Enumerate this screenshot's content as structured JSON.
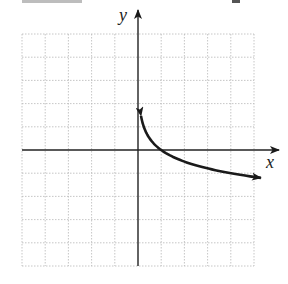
{
  "figure": {
    "x_axis_label": "x",
    "y_axis_label": "y",
    "colors": {
      "axis": "#222222",
      "curve": "#1a1a1a",
      "grid": "#b8b8b8",
      "background": "#ffffff"
    }
  },
  "chart_data": {
    "type": "line",
    "title": "",
    "xlabel": "x",
    "ylabel": "y",
    "xlim": [
      -5,
      5
    ],
    "ylim": [
      -5,
      5
    ],
    "grid": true,
    "grid_step": 1,
    "legend": null,
    "axes_arrows": true,
    "series": [
      {
        "name": "curve",
        "description": "decreasing logarithmic-type curve with vertical asymptote x = 0, arrows at both ends",
        "approx_equation": "y = -log_4(x)",
        "x": [
          0.13,
          0.25,
          0.5,
          1,
          2,
          3,
          4,
          5.3
        ],
        "y": [
          1.47,
          1.0,
          0.5,
          0.0,
          -0.5,
          -0.79,
          -1.0,
          -1.2
        ]
      }
    ]
  }
}
